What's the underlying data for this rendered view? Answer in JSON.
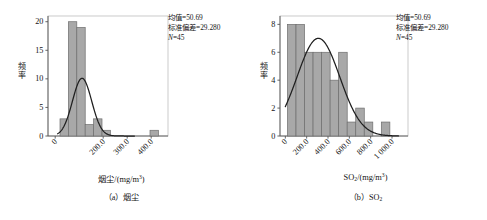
{
  "figure": {
    "background": "#ffffff",
    "bar_fill": "#a8a8a8",
    "bar_stroke": "#6e6e6e",
    "curve_color": "#1f1f1f",
    "axis_color": "#555555",
    "frame_color": "#bdbdbd"
  },
  "panels": [
    {
      "id": "a",
      "caption": "（a）烟尘",
      "caption_prefix": "（a）",
      "caption_name": "烟尘",
      "axis_title_main": "烟尘/(mg/m",
      "axis_title_sup": "3",
      "axis_title_tail": ")",
      "ylabel_chars": [
        "频",
        "率"
      ],
      "stats": {
        "mean_label": "均值",
        "mean_value": "50.69",
        "sd_label": "标准偏差",
        "sd_value": "29.280",
        "n_label": "N",
        "n_value": "45",
        "lines": [
          "均值=50.69",
          "标准偏差=29.280",
          "N=45"
        ]
      },
      "chart_data": {
        "type": "bar",
        "title": "",
        "xlabel": "烟尘/(mg/m3)",
        "ylabel": "频率",
        "xlim": [
          -30,
          470
        ],
        "ylim": [
          0,
          21
        ],
        "xticks": [
          0,
          200,
          300,
          400
        ],
        "xticklabels": [
          "0",
          "200.0",
          "300.0",
          "400.0"
        ],
        "yticks": [
          0,
          5,
          10,
          15,
          20
        ],
        "yticklabels": [
          "0",
          "5",
          "10",
          "15",
          "20"
        ],
        "grid": false,
        "legend": "none",
        "bin_width": 35,
        "bins": [
          {
            "x0": 20,
            "x1": 55,
            "value": 3
          },
          {
            "x0": 55,
            "x1": 90,
            "value": 20
          },
          {
            "x0": 90,
            "x1": 125,
            "value": 19
          },
          {
            "x0": 125,
            "x1": 160,
            "value": 2
          },
          {
            "x0": 160,
            "x1": 195,
            "value": 3
          },
          {
            "x0": 195,
            "x1": 230,
            "value": 1
          },
          {
            "x0": 395,
            "x1": 430,
            "value": 1
          }
        ],
        "categories": [
          "20-55",
          "55-90",
          "90-125",
          "125-160",
          "160-195",
          "195-230",
          "395-430"
        ],
        "values": [
          3,
          20,
          19,
          2,
          3,
          1,
          1
        ],
        "normal_curve": {
          "amplitude": 10.1,
          "center": 112,
          "sigma": 40,
          "x_start": 10,
          "x_end": 330
        },
        "annotation": "均值=50.69 标准偏差=29.280 N=45"
      }
    },
    {
      "id": "b",
      "caption": "（b）SO2",
      "caption_prefix": "（b）",
      "caption_name": "SO",
      "caption_sub": "2",
      "axis_title_main": "SO",
      "axis_title_sub": "2",
      "axis_title_mid": "/(mg/m",
      "axis_title_sup": "3",
      "axis_title_tail": ")",
      "ylabel_chars": [
        "频",
        "率"
      ],
      "stats": {
        "mean_label": "均值",
        "mean_value": "50.69",
        "sd_label": "标准偏差",
        "sd_value": "29.280",
        "n_label": "N",
        "n_value": "45",
        "lines": [
          "均值=50.69",
          "标准偏差=29.280",
          "N=45"
        ]
      },
      "chart_data": {
        "type": "bar",
        "title": "",
        "xlabel": "SO2/(mg/m3)",
        "ylabel": "频率",
        "xlim": [
          -50,
          1150
        ],
        "ylim": [
          0,
          8.6
        ],
        "xticks": [
          0,
          200,
          400,
          600,
          800,
          1000
        ],
        "xticklabels": [
          "0",
          "200.0",
          "400.0",
          "600.0",
          "800.0",
          "1 000.0"
        ],
        "yticks": [
          0,
          2,
          4,
          6,
          8
        ],
        "yticklabels": [
          "0",
          "2",
          "4",
          "6",
          "8"
        ],
        "grid": false,
        "legend": "none",
        "bin_width": 80,
        "bins": [
          {
            "x0": 20,
            "x1": 100,
            "value": 8
          },
          {
            "x0": 100,
            "x1": 180,
            "value": 8
          },
          {
            "x0": 180,
            "x1": 260,
            "value": 6
          },
          {
            "x0": 260,
            "x1": 340,
            "value": 6
          },
          {
            "x0": 340,
            "x1": 420,
            "value": 6
          },
          {
            "x0": 420,
            "x1": 500,
            "value": 4
          },
          {
            "x0": 500,
            "x1": 580,
            "value": 6
          },
          {
            "x0": 580,
            "x1": 660,
            "value": 1
          },
          {
            "x0": 660,
            "x1": 740,
            "value": 2
          },
          {
            "x0": 740,
            "x1": 820,
            "value": 1
          },
          {
            "x0": 900,
            "x1": 980,
            "value": 1
          }
        ],
        "categories": [
          "20-100",
          "100-180",
          "180-260",
          "260-340",
          "340-420",
          "420-500",
          "500-580",
          "580-660",
          "660-740",
          "740-820",
          "900-980"
        ],
        "values": [
          8,
          8,
          6,
          6,
          6,
          4,
          6,
          1,
          2,
          1,
          1
        ],
        "normal_curve": {
          "amplitude": 7.0,
          "center": 310,
          "sigma": 200,
          "x_start": 0,
          "x_end": 1060
        },
        "annotation": "均值=50.69 标准偏差=29.280 N=45"
      }
    }
  ]
}
